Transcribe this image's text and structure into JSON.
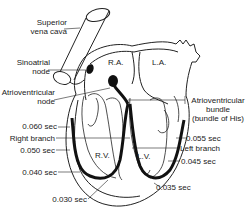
{
  "labels": {
    "superior_vena_cava": [
      "Superior",
      "vena cava"
    ],
    "sinoatrial_node": [
      "Sinoatrial",
      "node"
    ],
    "atrioventricular_node": [
      "Atrioventricular",
      "node"
    ],
    "right_atrium": "R.A.",
    "left_atrium": "L.A.",
    "right_ventricle": "R.V.",
    "left_ventricle": "L.V.",
    "av_bundle": [
      "Atrioventricular",
      "bundle",
      "(bundle of His)"
    ],
    "right_branch": "Right branch",
    "left_branch": "Left branch"
  },
  "timings": {
    "right_060": "0.060 sec",
    "right_050": "0.050 sec",
    "right_040": "0.040 sec",
    "right_030": "0.030 sec",
    "left_055": "0.055 sec",
    "left_045": "0.045 sec",
    "left_035": "0.035 sec"
  }
}
